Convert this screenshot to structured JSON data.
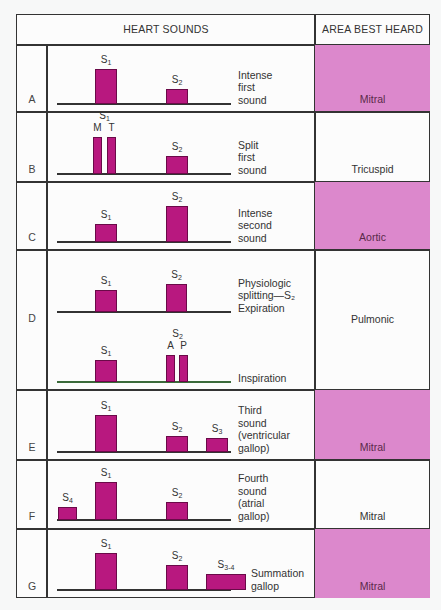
{
  "header": {
    "heart_sounds": "HEART SOUNDS",
    "area_best_heard": "AREA BEST HEARD"
  },
  "colors": {
    "bar_fill": "#b8187f",
    "area_highlight": "#dc88cc",
    "border": "#333333"
  },
  "rows": [
    {
      "id": "A",
      "top": 44,
      "bottom": 111,
      "area": "Mitral",
      "area_highlight": true,
      "description": "Intense\nfirst\nsound",
      "traces": [
        {
          "baseline_y": 103,
          "bars": [
            {
              "label": "S",
              "sub": "1",
              "x": 95,
              "w": 22,
              "h": 35
            },
            {
              "label": "S",
              "sub": "2",
              "x": 166,
              "w": 22,
              "h": 15
            }
          ]
        }
      ]
    },
    {
      "id": "B",
      "top": 111,
      "bottom": 181,
      "area": "Tricuspid",
      "area_highlight": false,
      "description": "Split\nfirst\nsound",
      "traces": [
        {
          "baseline_y": 173,
          "bars": [
            {
              "label": "M",
              "sub": "",
              "x": 93,
              "w": 9,
              "h": 37,
              "group_label": "S",
              "group_sub": "1"
            },
            {
              "label": "T",
              "sub": "",
              "x": 107,
              "w": 9,
              "h": 37
            },
            {
              "label": "S",
              "sub": "2",
              "x": 166,
              "w": 22,
              "h": 18
            }
          ]
        }
      ]
    },
    {
      "id": "C",
      "top": 181,
      "bottom": 249,
      "area": "Aortic",
      "area_highlight": true,
      "description": "Intense\nsecond\nsound",
      "traces": [
        {
          "baseline_y": 241,
          "bars": [
            {
              "label": "S",
              "sub": "1",
              "x": 95,
              "w": 22,
              "h": 18
            },
            {
              "label": "S",
              "sub": "2",
              "x": 166,
              "w": 22,
              "h": 36
            }
          ]
        }
      ]
    },
    {
      "id": "D",
      "top": 249,
      "bottom": 389,
      "area": "Pulmonic",
      "area_highlight": false,
      "traces": [
        {
          "baseline_y": 311,
          "description": "Physiologic\nsplitting—S₂\nExpiration",
          "bars": [
            {
              "label": "S",
              "sub": "1",
              "x": 95,
              "w": 22,
              "h": 22
            },
            {
              "label": "S",
              "sub": "2",
              "x": 166,
              "w": 21,
              "h": 28
            }
          ]
        },
        {
          "baseline_y": 381,
          "description": "Inspiration",
          "green": true,
          "bars": [
            {
              "label": "S",
              "sub": "1",
              "x": 95,
              "w": 22,
              "h": 22
            },
            {
              "label": "A",
              "sub": "",
              "x": 166,
              "w": 9,
              "h": 27,
              "group_label": "S",
              "group_sub": "2"
            },
            {
              "label": "P",
              "sub": "",
              "x": 179,
              "w": 9,
              "h": 27
            }
          ]
        }
      ]
    },
    {
      "id": "E",
      "top": 389,
      "bottom": 459,
      "area": "Mitral",
      "area_highlight": true,
      "description": "Third\nsound\n(ventricular\ngallop)",
      "traces": [
        {
          "baseline_y": 451,
          "bars": [
            {
              "label": "S",
              "sub": "1",
              "x": 95,
              "w": 22,
              "h": 37
            },
            {
              "label": "S",
              "sub": "2",
              "x": 166,
              "w": 22,
              "h": 16
            },
            {
              "label": "S",
              "sub": "3",
              "x": 206,
              "w": 22,
              "h": 14
            }
          ]
        }
      ]
    },
    {
      "id": "F",
      "top": 459,
      "bottom": 528,
      "area": "Mitral",
      "area_highlight": false,
      "description": "Fourth\nsound\n(atrial\ngallop)",
      "traces": [
        {
          "baseline_y": 519,
          "bars": [
            {
              "label": "S",
              "sub": "4",
              "x": 58,
              "w": 19,
              "h": 13
            },
            {
              "label": "S",
              "sub": "1",
              "x": 95,
              "w": 22,
              "h": 38
            },
            {
              "label": "S",
              "sub": "2",
              "x": 166,
              "w": 22,
              "h": 18
            }
          ]
        }
      ]
    },
    {
      "id": "G",
      "top": 528,
      "bottom": 598,
      "area": "Mitral",
      "area_highlight": true,
      "description": "Summation\ngallop",
      "traces": [
        {
          "baseline_y": 589,
          "bars": [
            {
              "label": "S",
              "sub": "1",
              "x": 95,
              "w": 22,
              "h": 37
            },
            {
              "label": "S",
              "sub": "2",
              "x": 166,
              "w": 22,
              "h": 25
            },
            {
              "label": "S",
              "sub": "3-4",
              "x": 206,
              "w": 40,
              "h": 16
            }
          ]
        }
      ]
    }
  ]
}
